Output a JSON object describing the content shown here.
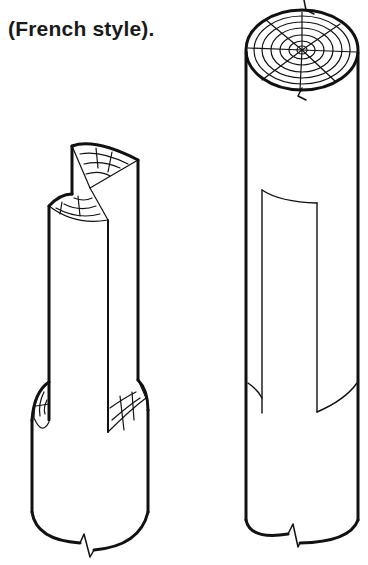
{
  "caption": {
    "line1": "Joint cut in lap-splice",
    "line2": "(French style)."
  },
  "figure": {
    "left_log": {
      "label": "assembled halves",
      "cut": "stepped half-lap with end grain rings"
    },
    "right_log": {
      "label": "single log with marked cut",
      "cut": "outline of lap on face"
    },
    "ink_color": "#111111",
    "background": "#ffffff"
  }
}
